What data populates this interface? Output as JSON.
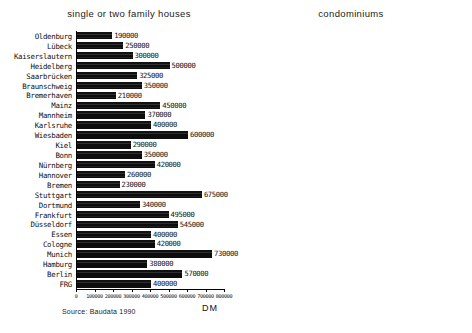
{
  "source_note": "Source: Baudata 1990",
  "chart_data": [
    {
      "type": "bar",
      "orientation": "horizontal",
      "title": "single or two family houses",
      "xlabel": "DM",
      "ylabel": "",
      "xlim": [
        0,
        800000
      ],
      "xticks": [
        0,
        100000,
        200000,
        300000,
        400000,
        500000,
        600000,
        700000,
        800000
      ],
      "xtick_labels": [
        "0",
        "100000",
        "200000",
        "300000",
        "400000",
        "500000",
        "600000",
        "700000",
        "800000"
      ],
      "grid": false,
      "legend": "none",
      "categories": [
        "Oldenburg",
        "Lübeck",
        "Kaiserslautern",
        "Heidelberg",
        "Saarbrücken",
        "Braunschweig",
        "Bremerhaven",
        "Mainz",
        "Mannheim",
        "Karlsruhe",
        "Wiesbaden",
        "Kiel",
        "Bonn",
        "Nürnberg",
        "Hannover",
        "Bremen",
        "Stuttgart",
        "Dortmund",
        "Frankfurt",
        "Düsseldorf",
        "Essen",
        "Cologne",
        "Munich",
        "Hamburg",
        "Berlin",
        "FRG"
      ],
      "values": [
        190000,
        250000,
        300000,
        500000,
        325000,
        350000,
        210000,
        450000,
        370000,
        400000,
        600000,
        290000,
        350000,
        420000,
        260000,
        230000,
        675000,
        340000,
        495000,
        545000,
        400000,
        420000,
        730000,
        380000,
        570000,
        400000
      ],
      "value_labels": [
        "190000",
        "250000",
        "300000",
        "500000",
        "325000",
        "350000",
        "210000",
        "450000",
        "370000",
        "400000",
        "600000",
        "290000",
        "350000",
        "420000",
        "260000",
        "230000",
        "675000",
        "340000",
        "495000",
        "545000",
        "400000",
        "420000",
        "730000",
        "380000",
        "570000",
        "400000"
      ]
    },
    {
      "type": "bar",
      "orientation": "horizontal",
      "title": "condominiums",
      "xlabel": "DM/sq.m",
      "ylabel": "",
      "xlim": [
        0,
        4500
      ],
      "xticks": [
        0,
        500,
        1000,
        1500,
        2000,
        2500,
        3000,
        3500,
        4000,
        4500
      ],
      "xtick_labels": [
        "0",
        "500",
        "1000",
        "1500",
        "2000",
        "2500",
        "3000",
        "3500",
        "4000",
        "4500"
      ],
      "grid": false,
      "legend": "none",
      "categories": [
        "Oldenburg",
        "Lübeck",
        "Kaiserslautern",
        "Heidelberg",
        "Saarbrücken",
        "Braunschweig",
        "Bremerhaven",
        "Mainz",
        "Mannheim",
        "Karlsruhe",
        "Wiesbaden",
        "Kiel",
        "Bonn",
        "Nürnberg",
        "Hannover",
        "Bremen",
        "Stuttgart",
        "Dortmund",
        "Frankfurt",
        "Düsseldorf",
        "Essen",
        "Cologne",
        "Munich",
        "Hamburg",
        "Berlin",
        "FRG"
      ],
      "values": [
        1575,
        1700,
        1800,
        3100,
        1650,
        1500,
        1500,
        2400,
        2200,
        2800,
        3500,
        1950,
        2800,
        2300,
        1600,
        1600,
        3250,
        1800,
        2800,
        4100,
        2500,
        2750,
        3700,
        2750,
        2800,
        2400
      ],
      "value_labels": [
        "1575",
        "1700",
        "1800",
        "3100",
        "1650",
        "1500",
        "1500",
        "2400",
        "2200",
        "2800",
        "3500",
        "1950",
        "2800",
        "2300",
        "1600",
        "1600",
        "3250",
        "1800",
        "2800",
        "4100",
        "2500",
        "2750",
        "3700",
        "2750",
        "2800",
        "2400"
      ]
    }
  ]
}
